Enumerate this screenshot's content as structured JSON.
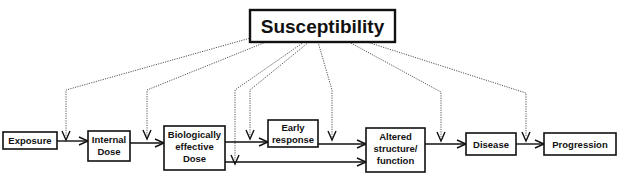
{
  "diagram": {
    "title": "Susceptibility",
    "nodes": [
      {
        "id": "exposure",
        "lines": [
          "Exposure"
        ]
      },
      {
        "id": "internal_dose",
        "lines": [
          "Internal",
          "Dose"
        ]
      },
      {
        "id": "biologically_effective_dose",
        "lines": [
          "Biologically",
          "effective",
          "Dose"
        ]
      },
      {
        "id": "early_response",
        "lines": [
          "Early",
          "response"
        ]
      },
      {
        "id": "altered_structure_function",
        "lines": [
          "Altered",
          "structure/",
          "function"
        ]
      },
      {
        "id": "disease",
        "lines": [
          "Disease"
        ]
      },
      {
        "id": "progression",
        "lines": [
          "Progression"
        ]
      }
    ],
    "edges": [
      {
        "from": "exposure",
        "to": "internal_dose",
        "style": "solid-arrow"
      },
      {
        "from": "internal_dose",
        "to": "biologically_effective_dose",
        "style": "solid-arrow"
      },
      {
        "from": "biologically_effective_dose",
        "to": "early_response",
        "style": "solid-arrow"
      },
      {
        "from": "biologically_effective_dose",
        "to": "altered_structure_function",
        "style": "solid-arrow"
      },
      {
        "from": "early_response",
        "to": "altered_structure_function",
        "style": "solid-arrow"
      },
      {
        "from": "altered_structure_function",
        "to": "disease",
        "style": "solid-arrow"
      },
      {
        "from": "disease",
        "to": "progression",
        "style": "solid-arrow"
      }
    ],
    "modifiers": {
      "source": "Susceptibility",
      "style": "dotted-arrow",
      "targets": [
        "exposure->internal_dose",
        "internal_dose->biologically_effective_dose",
        "biologically_effective_dose->altered_structure_function",
        "biologically_effective_dose->early_response",
        "early_response->altered_structure_function",
        "altered_structure_function->disease",
        "disease->progression"
      ]
    },
    "colors": {
      "box_stroke": "#111111",
      "text": "#111111",
      "dotted_line": "#555555",
      "background": "#ffffff"
    }
  }
}
